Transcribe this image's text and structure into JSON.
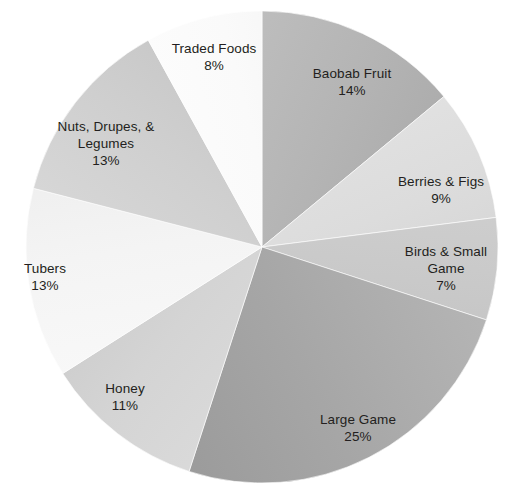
{
  "chart_data": {
    "type": "pie",
    "title": "",
    "subtitle": "",
    "xlabel": "",
    "ylabel": "",
    "grid": false,
    "legend_position": "none",
    "label_format": "name + percent",
    "start_angle_deg": 0,
    "direction": "clockwise",
    "total_percent": 100,
    "categories": [
      "Baobab Fruit",
      "Berries & Figs",
      "Birds & Small Game",
      "Large Game",
      "Honey",
      "Tubers",
      "Nuts, Drupes, & Legumes",
      "Traded Foods"
    ],
    "values": [
      14,
      9,
      7,
      25,
      11,
      13,
      13,
      8
    ],
    "slices": [
      {
        "id": "baobab-fruit",
        "label_lines": [
          "Baobab Fruit"
        ],
        "value": 14,
        "value_text": "14%",
        "color": "#b4b4b4",
        "color_light": "#c3c3c3",
        "color_dark": "#a6a6a6"
      },
      {
        "id": "berries-figs",
        "label_lines": [
          "Berries & Figs"
        ],
        "value": 9,
        "value_text": "9%",
        "color": "#dcdcdc",
        "color_light": "#e7e7e7",
        "color_dark": "#cfcfcf"
      },
      {
        "id": "birds-small-game",
        "label_lines": [
          "Birds & Small",
          "Game"
        ],
        "value": 7,
        "value_text": "7%",
        "color": "#c9c9c9",
        "color_light": "#d6d6d6",
        "color_dark": "#bdbdbd"
      },
      {
        "id": "large-game",
        "label_lines": [
          "Large Game"
        ],
        "value": 25,
        "value_text": "25%",
        "color": "#a6a6a6",
        "color_light": "#b6b6b6",
        "color_dark": "#9a9a9a"
      },
      {
        "id": "honey",
        "label_lines": [
          "Honey"
        ],
        "value": 11,
        "value_text": "11%",
        "color": "#d4d4d4",
        "color_light": "#dfdfdf",
        "color_dark": "#c6c6c6"
      },
      {
        "id": "tubers",
        "label_lines": [
          "Tubers"
        ],
        "value": 13,
        "value_text": "13%",
        "color": "#f4f4f4",
        "color_light": "#fbfbfb",
        "color_dark": "#eaeaea"
      },
      {
        "id": "nuts-drupes-legumes",
        "label_lines": [
          "Nuts, Drupes, &",
          "Legumes"
        ],
        "value": 13,
        "value_text": "13%",
        "color": "#cfcfcf",
        "color_light": "#dcdcdc",
        "color_dark": "#c2c2c2"
      },
      {
        "id": "traded-foods",
        "label_lines": [
          "Traded Foods"
        ],
        "value": 8,
        "value_text": "8%",
        "color": "#fafafa",
        "color_light": "#ffffff",
        "color_dark": "#f0f0f0"
      }
    ],
    "geometry": {
      "center_x": 262,
      "center_y": 247,
      "radius": 236
    },
    "background_color": "#ffffff",
    "label_text_color": "#231f20"
  },
  "labels": {
    "baobab_fruit": {
      "name": "Baobab Fruit",
      "value": "14%"
    },
    "berries_figs": {
      "name": "Berries & Figs",
      "value": "9%"
    },
    "birds_small_game": {
      "name_line1": "Birds & Small",
      "name_line2": "Game",
      "value": "7%"
    },
    "large_game": {
      "name": "Large Game",
      "value": "25%"
    },
    "honey": {
      "name": "Honey",
      "value": "11%"
    },
    "tubers": {
      "name": "Tubers",
      "value": "13%"
    },
    "nuts_drupes_legumes": {
      "name_line1": "Nuts, Drupes, &",
      "name_line2": "Legumes",
      "value": "13%"
    },
    "traded_foods": {
      "name": "Traded Foods",
      "value": "8%"
    }
  }
}
